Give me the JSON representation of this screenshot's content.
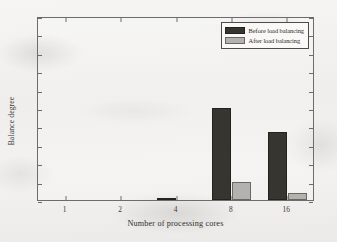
{
  "chart_data": {
    "type": "bar",
    "title": "",
    "xlabel": "Number of processing cores",
    "ylabel": "Balance degree",
    "categories": [
      "1",
      "2",
      "4",
      "8",
      "16"
    ],
    "ylim": [
      0,
      1
    ],
    "yticks": [
      0,
      0.1,
      0.2,
      0.3,
      0.4,
      0.5,
      0.6,
      0.7,
      0.8,
      0.9,
      1
    ],
    "ytick_labels": [
      "0",
      "0.1",
      "0.2",
      "0.3",
      "0.4",
      "0.5",
      "0.6",
      "0.7",
      "0.8",
      "0.9",
      "1"
    ],
    "grid": false,
    "legend_position": "top-right",
    "series": [
      {
        "name": "Before load balancing",
        "color": "#36352f",
        "values": [
          0,
          0,
          0.008,
          0.5,
          0.37
        ]
      },
      {
        "name": "After load balancing",
        "color": "#b4b2ae",
        "values": [
          0,
          0,
          0,
          0.098,
          0.038
        ]
      }
    ]
  }
}
